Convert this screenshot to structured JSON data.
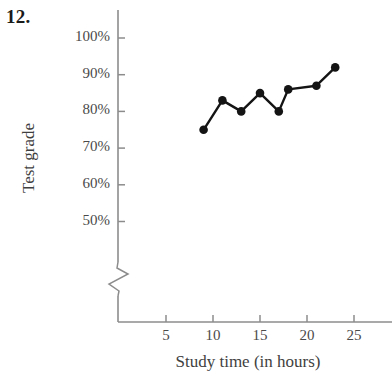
{
  "problem": {
    "number": "12."
  },
  "chart_data": {
    "type": "line",
    "title": "",
    "xlabel": "Study time (in hours)",
    "ylabel": "Test grade",
    "x": [
      9,
      11,
      13,
      15,
      17,
      18,
      21,
      23
    ],
    "values": [
      75,
      83,
      80,
      85,
      80,
      86,
      87,
      92
    ],
    "points": [
      {
        "x": 9,
        "y": 75
      },
      {
        "x": 11,
        "y": 83
      },
      {
        "x": 13,
        "y": 80
      },
      {
        "x": 15,
        "y": 85
      },
      {
        "x": 17,
        "y": 80
      },
      {
        "x": 18,
        "y": 86
      },
      {
        "x": 21,
        "y": 87
      },
      {
        "x": 23,
        "y": 92
      }
    ],
    "x_tick_labels": [
      "5",
      "10",
      "15",
      "20",
      "25"
    ],
    "x_ticks": [
      5,
      10,
      15,
      20,
      25
    ],
    "y_tick_labels": [
      "100%",
      "90%",
      "80%",
      "70%",
      "60%",
      "50%"
    ],
    "y_ticks": [
      100,
      90,
      80,
      70,
      60,
      50
    ],
    "xlim": [
      0,
      28
    ],
    "ylim": [
      45,
      104
    ],
    "grid": false,
    "legend": "none",
    "axis_break": {
      "axis": "y",
      "symbol": "zigzag",
      "note": "y-axis broken below 50%"
    },
    "marker": "filled-circle",
    "line_color": "#141414",
    "marker_color": "#141414",
    "axis_color": "#8c8c8c"
  }
}
